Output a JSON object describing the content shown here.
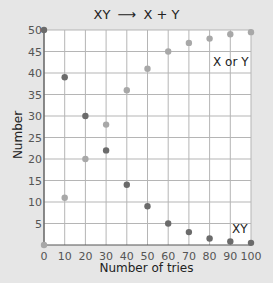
{
  "chart_data": {
    "type": "scatter",
    "title_left": "XY",
    "title_arrow": "⟶",
    "title_right": "X + Y",
    "title": "XY ⟶ X + Y",
    "xlabel": "Number of tries",
    "ylabel": "Number",
    "xlim": [
      0,
      100
    ],
    "ylim": [
      0,
      50
    ],
    "x_ticks": [
      0,
      10,
      20,
      30,
      40,
      50,
      60,
      70,
      80,
      90,
      100
    ],
    "y_ticks": [
      5,
      10,
      15,
      20,
      25,
      30,
      35,
      40,
      45,
      50
    ],
    "grid": true,
    "x": [
      0,
      10,
      20,
      30,
      40,
      50,
      60,
      70,
      80,
      90,
      100
    ],
    "series": [
      {
        "name": "XY",
        "color": "#6b6b6b",
        "values": [
          50,
          39,
          30,
          22,
          14,
          9,
          5,
          3,
          1.5,
          0.8,
          0.5
        ]
      },
      {
        "name": "X or Y",
        "color": "#a8a8a8",
        "values": [
          0,
          11,
          20,
          28,
          36,
          41,
          45,
          47,
          48,
          49,
          49.5
        ]
      }
    ],
    "annotations": [
      {
        "text": "X or Y",
        "near": "upper right"
      },
      {
        "text": "XY",
        "near": "lower right"
      }
    ]
  }
}
